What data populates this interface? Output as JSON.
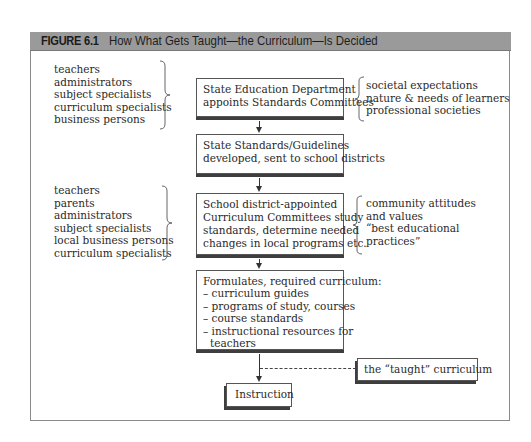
{
  "figure": {
    "label": "FIGURE 6.1",
    "title": "How What Gets Taught—the Curriculum—Is Decided"
  },
  "steps": [
    {
      "lines": [
        "State Education Department",
        "appoints Standards Committees"
      ]
    },
    {
      "lines": [
        "State Standards/Guidelines",
        "developed, sent to school districts"
      ]
    },
    {
      "lines": [
        "School district-appointed",
        "Curriculum Committees study",
        "standards, determine needed",
        "changes in local programs etc."
      ]
    },
    {
      "lines": [
        "Formulates, required curriculum:",
        "– curriculum guides",
        "– programs of study, courses",
        "– course standards",
        "– instructional resources for",
        "   teachers"
      ]
    },
    {
      "lines": [
        "Instruction"
      ]
    }
  ],
  "left_groups": [
    {
      "items": [
        "teachers",
        "administrators",
        "subject specialists",
        "curriculum specialists",
        "business persons"
      ]
    },
    {
      "items": [
        "teachers",
        "parents",
        "administrators",
        "subject specialists",
        "local business persons",
        "curriculum specialists"
      ]
    }
  ],
  "right_groups": [
    {
      "items": [
        "societal expectations",
        "nature & needs of learners",
        "professional societies"
      ]
    },
    {
      "items": [
        "community attitudes",
        "and values",
        "“best educational",
        "practices”"
      ]
    }
  ],
  "taught_label": "the “taught” curriculum",
  "colors": {
    "title_bar": "#9a9a9a",
    "shadow": "#3e3e3e",
    "frame": "#8a8a8a"
  }
}
